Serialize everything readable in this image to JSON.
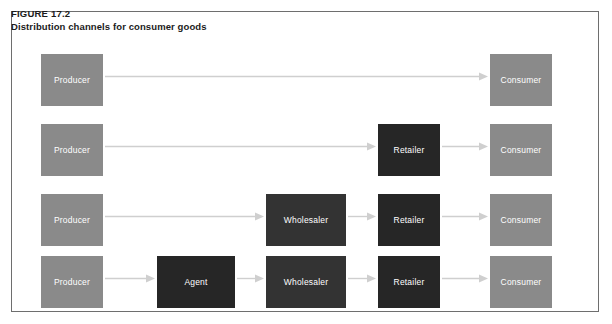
{
  "figure": {
    "label": "FIGURE 17.2",
    "title": "Distribution channels for consumer goods"
  },
  "colors": {
    "producer": "#8a8a8a",
    "consumer": "#8a8a8a",
    "wholesaler": "#333333",
    "retailer": "#262626",
    "agent": "#262626",
    "arrow": "#cfcfcf",
    "frame_border": "#6e6e6e",
    "box_text": "#ffffff",
    "title_text": "#1b1b1b",
    "background": "#ffffff"
  },
  "chart_data": {
    "type": "diagram",
    "title": "Distribution channels for consumer goods",
    "rows": [
      {
        "name": "channel-direct",
        "nodes": [
          {
            "label": "Producer",
            "role": "producer",
            "x": 41,
            "y": 54,
            "w": 62,
            "h": 52
          },
          {
            "label": "Consumer",
            "role": "consumer",
            "x": 490,
            "y": 54,
            "w": 62,
            "h": 52
          }
        ],
        "arrows": [
          {
            "x": 105,
            "y": 76,
            "w": 383
          }
        ]
      },
      {
        "name": "channel-retailer",
        "nodes": [
          {
            "label": "Producer",
            "role": "producer",
            "x": 41,
            "y": 124,
            "w": 62,
            "h": 52
          },
          {
            "label": "Retailer",
            "role": "retailer",
            "x": 378,
            "y": 124,
            "w": 62,
            "h": 52
          },
          {
            "label": "Consumer",
            "role": "consumer",
            "x": 490,
            "y": 124,
            "w": 62,
            "h": 52
          }
        ],
        "arrows": [
          {
            "x": 105,
            "y": 146,
            "w": 271
          },
          {
            "x": 442,
            "y": 146,
            "w": 46
          }
        ]
      },
      {
        "name": "channel-wholesaler-retailer",
        "nodes": [
          {
            "label": "Producer",
            "role": "producer",
            "x": 41,
            "y": 194,
            "w": 62,
            "h": 52
          },
          {
            "label": "Wholesaler",
            "role": "wholesaler",
            "x": 266,
            "y": 194,
            "w": 80,
            "h": 52
          },
          {
            "label": "Retailer",
            "role": "retailer",
            "x": 378,
            "y": 194,
            "w": 62,
            "h": 52
          },
          {
            "label": "Consumer",
            "role": "consumer",
            "x": 490,
            "y": 194,
            "w": 62,
            "h": 52
          }
        ],
        "arrows": [
          {
            "x": 105,
            "y": 216,
            "w": 159
          },
          {
            "x": 348,
            "y": 216,
            "w": 28
          },
          {
            "x": 442,
            "y": 216,
            "w": 46
          }
        ]
      },
      {
        "name": "channel-agent-wholesaler-retailer",
        "nodes": [
          {
            "label": "Producer",
            "role": "producer",
            "x": 41,
            "y": 256,
            "w": 62,
            "h": 52
          },
          {
            "label": "Agent",
            "role": "agent",
            "x": 157,
            "y": 256,
            "w": 78,
            "h": 52
          },
          {
            "label": "Wholesaler",
            "role": "wholesaler",
            "x": 266,
            "y": 256,
            "w": 80,
            "h": 52
          },
          {
            "label": "Retailer",
            "role": "retailer",
            "x": 378,
            "y": 256,
            "w": 62,
            "h": 52
          },
          {
            "label": "Consumer",
            "role": "consumer",
            "x": 490,
            "y": 256,
            "w": 62,
            "h": 52
          }
        ],
        "arrows": [
          {
            "x": 105,
            "y": 278,
            "w": 50
          },
          {
            "x": 237,
            "y": 278,
            "w": 27
          },
          {
            "x": 348,
            "y": 278,
            "w": 28
          },
          {
            "x": 442,
            "y": 278,
            "w": 46
          }
        ]
      }
    ]
  }
}
